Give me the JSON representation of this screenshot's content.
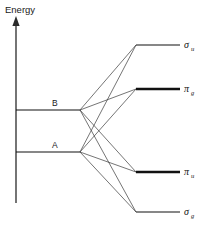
{
  "diagram": {
    "kind": "molecular-orbital-correlation-diagram",
    "axis": {
      "label": "Energy",
      "direction": "up",
      "arrow_icon": "up-arrow-icon",
      "x": 16,
      "y_top": 18,
      "y_bottom": 203
    },
    "atomic_levels": [
      {
        "id": "level-b",
        "label": "B",
        "y": 110,
        "x_start": 16,
        "x_end": 80,
        "weight": "thin",
        "label_x": 52,
        "label_y": 106
      },
      {
        "id": "level-a",
        "label": "A",
        "y": 152,
        "x_start": 16,
        "x_end": 80,
        "weight": "thin",
        "label_x": 52,
        "label_y": 148
      }
    ],
    "molecular_levels": [
      {
        "id": "mo-sigma-u",
        "symbol": "σ",
        "subscript": "u",
        "label": "σu",
        "y": 45,
        "x_start": 136,
        "x_end": 180,
        "weight": "thin",
        "degeneracy": 1,
        "label_x": 184,
        "label_y": 48
      },
      {
        "id": "mo-pi-g",
        "symbol": "π",
        "subscript": "g",
        "label": "πg",
        "y": 89,
        "x_start": 136,
        "x_end": 180,
        "weight": "thick",
        "degeneracy": 2,
        "label_x": 184,
        "label_y": 92
      },
      {
        "id": "mo-pi-u",
        "symbol": "π",
        "subscript": "u",
        "label": "πu",
        "y": 172,
        "x_start": 136,
        "x_end": 180,
        "weight": "thick",
        "degeneracy": 2,
        "label_x": 184,
        "label_y": 175
      },
      {
        "id": "mo-sigma-g",
        "symbol": "σ",
        "subscript": "g",
        "label": "σg",
        "y": 212,
        "x_start": 136,
        "x_end": 180,
        "weight": "thin",
        "degeneracy": 1,
        "label_x": 184,
        "label_y": 215
      }
    ],
    "correlations": [
      {
        "id": "corr-b-sigma-u",
        "from": "level-b",
        "to": "mo-sigma-u",
        "x1": 80,
        "y1": 110,
        "x2": 136,
        "y2": 45
      },
      {
        "id": "corr-b-pi-g",
        "from": "level-b",
        "to": "mo-pi-g",
        "x1": 80,
        "y1": 110,
        "x2": 136,
        "y2": 89
      },
      {
        "id": "corr-b-pi-u",
        "from": "level-b",
        "to": "mo-pi-u",
        "x1": 80,
        "y1": 110,
        "x2": 136,
        "y2": 172
      },
      {
        "id": "corr-b-sigma-g",
        "from": "level-b",
        "to": "mo-sigma-g",
        "x1": 80,
        "y1": 110,
        "x2": 136,
        "y2": 212
      },
      {
        "id": "corr-a-sigma-u",
        "from": "level-a",
        "to": "mo-sigma-u",
        "x1": 80,
        "y1": 152,
        "x2": 136,
        "y2": 45
      },
      {
        "id": "corr-a-pi-g",
        "from": "level-a",
        "to": "mo-pi-g",
        "x1": 80,
        "y1": 152,
        "x2": 136,
        "y2": 89
      },
      {
        "id": "corr-a-pi-u",
        "from": "level-a",
        "to": "mo-pi-u",
        "x1": 80,
        "y1": 152,
        "x2": 136,
        "y2": 172
      },
      {
        "id": "corr-a-sigma-g",
        "from": "level-a",
        "to": "mo-sigma-g",
        "x1": 80,
        "y1": 152,
        "x2": 136,
        "y2": 212
      }
    ],
    "colors": {
      "background": "#ffffff",
      "line": "#111111",
      "correlation": "#3a3a3a",
      "axis": "#2a2a2a",
      "text": "#1a1a1a"
    }
  }
}
